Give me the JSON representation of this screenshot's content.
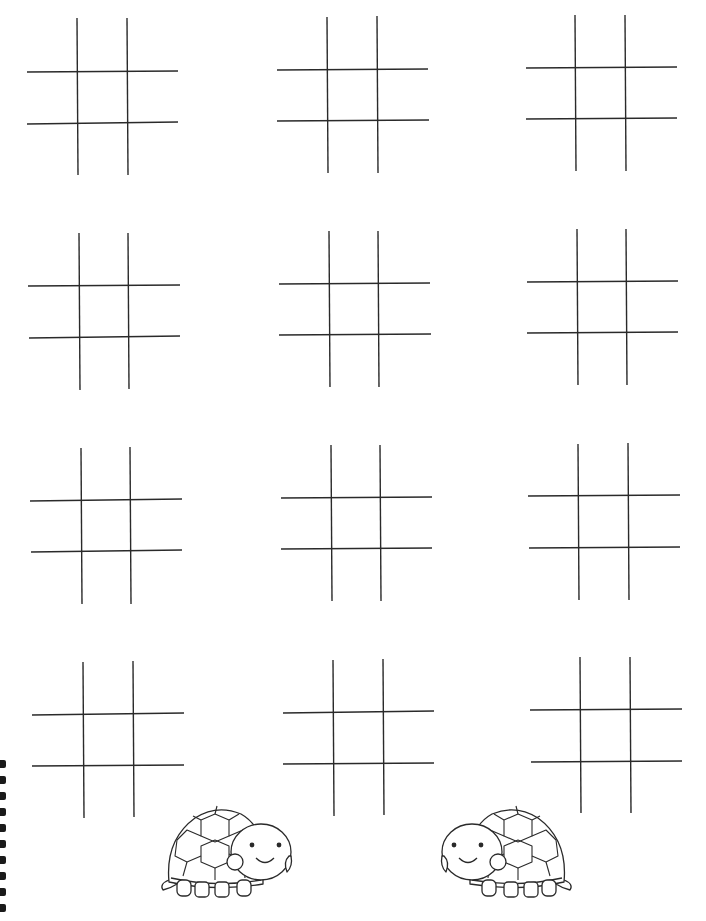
{
  "worksheet": {
    "title": "",
    "description": "Tic-tac-toe printable worksheet with 12 empty boards and two turtle illustrations",
    "line_color": "#2a2a2a",
    "background": "#ffffff",
    "board_count": 12,
    "boards": [
      {
        "row": 1,
        "col": 1,
        "v": [
          [
            77,
            18,
            78,
            175
          ],
          [
            127,
            18,
            128,
            175
          ]
        ],
        "h": [
          [
            27,
            72,
            178,
            71
          ],
          [
            27,
            124,
            178,
            122
          ]
        ]
      },
      {
        "row": 1,
        "col": 2,
        "v": [
          [
            327,
            17,
            328,
            173
          ],
          [
            377,
            16,
            378,
            173
          ]
        ],
        "h": [
          [
            277,
            70,
            428,
            69
          ],
          [
            277,
            121,
            429,
            120
          ]
        ]
      },
      {
        "row": 1,
        "col": 3,
        "v": [
          [
            575,
            15,
            576,
            171
          ],
          [
            625,
            15,
            626,
            171
          ]
        ],
        "h": [
          [
            526,
            68,
            677,
            67
          ],
          [
            526,
            119,
            677,
            118
          ]
        ]
      },
      {
        "row": 2,
        "col": 1,
        "v": [
          [
            79,
            233,
            80,
            390
          ],
          [
            128,
            233,
            129,
            389
          ]
        ],
        "h": [
          [
            28,
            286,
            180,
            285
          ],
          [
            29,
            338,
            180,
            336
          ]
        ]
      },
      {
        "row": 2,
        "col": 2,
        "v": [
          [
            329,
            231,
            330,
            387
          ],
          [
            378,
            231,
            379,
            387
          ]
        ],
        "h": [
          [
            279,
            284,
            430,
            283
          ],
          [
            279,
            335,
            431,
            334
          ]
        ]
      },
      {
        "row": 2,
        "col": 3,
        "v": [
          [
            577,
            229,
            578,
            385
          ],
          [
            626,
            229,
            627,
            385
          ]
        ],
        "h": [
          [
            527,
            282,
            678,
            281
          ],
          [
            527,
            333,
            678,
            332
          ]
        ]
      },
      {
        "row": 3,
        "col": 1,
        "v": [
          [
            81,
            448,
            82,
            604
          ],
          [
            130,
            447,
            131,
            604
          ]
        ],
        "h": [
          [
            30,
            501,
            182,
            499
          ],
          [
            31,
            552,
            182,
            550
          ]
        ]
      },
      {
        "row": 3,
        "col": 2,
        "v": [
          [
            331,
            445,
            332,
            601
          ],
          [
            380,
            445,
            381,
            601
          ]
        ],
        "h": [
          [
            281,
            498,
            432,
            497
          ],
          [
            281,
            549,
            432,
            548
          ]
        ]
      },
      {
        "row": 3,
        "col": 3,
        "v": [
          [
            578,
            444,
            579,
            600
          ],
          [
            628,
            443,
            629,
            600
          ]
        ],
        "h": [
          [
            528,
            496,
            680,
            495
          ],
          [
            529,
            548,
            680,
            547
          ]
        ]
      },
      {
        "row": 4,
        "col": 1,
        "v": [
          [
            83,
            662,
            84,
            818
          ],
          [
            133,
            661,
            134,
            817
          ]
        ],
        "h": [
          [
            32,
            715,
            184,
            713
          ],
          [
            32,
            766,
            184,
            765
          ]
        ]
      },
      {
        "row": 4,
        "col": 2,
        "v": [
          [
            333,
            660,
            334,
            816
          ],
          [
            383,
            659,
            384,
            815
          ]
        ],
        "h": [
          [
            283,
            713,
            434,
            711
          ],
          [
            283,
            764,
            434,
            763
          ]
        ]
      },
      {
        "row": 4,
        "col": 3,
        "v": [
          [
            580,
            657,
            581,
            813
          ],
          [
            630,
            657,
            631,
            813
          ]
        ],
        "h": [
          [
            530,
            710,
            682,
            709
          ],
          [
            531,
            762,
            682,
            761
          ]
        ]
      }
    ],
    "illustrations": [
      {
        "name": "turtle-left",
        "x": 157,
        "y": 800,
        "facing": "right"
      },
      {
        "name": "turtle-right",
        "x": 440,
        "y": 800,
        "facing": "left"
      }
    ],
    "binding_rings": [
      760,
      776,
      792,
      808,
      824,
      840,
      856,
      872,
      888,
      904
    ]
  }
}
